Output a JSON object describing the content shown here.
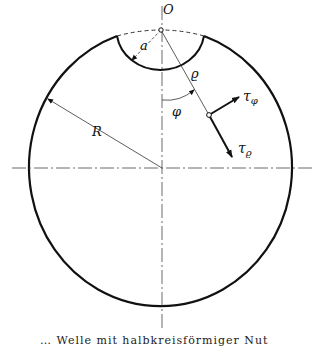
{
  "diagram": {
    "labels": {
      "origin": "O",
      "notch_radius": "a",
      "outer_radius": "R",
      "rho": "ϱ",
      "phi": "φ",
      "tau_phi_main": "τ",
      "tau_phi_sub": "φ",
      "tau_rho_main": "τ",
      "tau_rho_sub": "ϱ"
    },
    "caption": "… Welle mit halbkreisförmiger Nut"
  }
}
